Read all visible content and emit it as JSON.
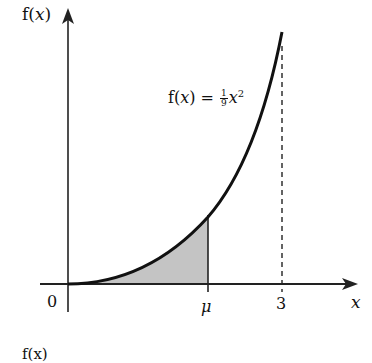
{
  "diagram": {
    "y_axis_label_f": "f(",
    "y_axis_label_x": "x",
    "y_axis_label_close": ")",
    "x_axis_label": "x",
    "origin_label": "0",
    "mu_label": "μ",
    "three_label": "3",
    "function_label": {
      "prefix": "f(",
      "var": "x",
      "mid": ") = ",
      "frac_num": "1",
      "frac_den": "9",
      "base": "x",
      "exp": "2"
    },
    "bottom_partial_label": "f(x)",
    "colors": {
      "curve": "#111111",
      "axis": "#222222",
      "shade": "#c4c4c4",
      "background": "#ffffff"
    }
  }
}
